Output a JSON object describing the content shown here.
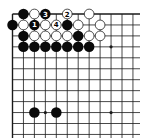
{
  "diagram": {
    "type": "go-board-partial",
    "view": "upper-left corner",
    "grid": {
      "origin_x": 12.5,
      "origin_y": 14,
      "spacing": 10.95,
      "cols_visible": 12,
      "rows_visible": 12,
      "edges": [
        "top",
        "left"
      ]
    },
    "colors": {
      "background": "#ffffff",
      "line": "#1a1a1a",
      "black_stone": "#0a0a0a",
      "white_stone_fill": "#ffffff",
      "white_stone_stroke": "#222222"
    },
    "star_points": [
      {
        "col": 9,
        "row": 3
      },
      {
        "col": 3,
        "row": 9
      },
      {
        "col": 9,
        "row": 9
      }
    ],
    "stones": [
      {
        "col": 1,
        "row": 0,
        "color": "black",
        "label": ""
      },
      {
        "col": 2,
        "row": 0,
        "color": "white",
        "label": ""
      },
      {
        "col": 3,
        "row": 0,
        "color": "black",
        "label": "3"
      },
      {
        "col": 5,
        "row": 0,
        "color": "white",
        "label": "2"
      },
      {
        "col": 7,
        "row": 0,
        "color": "white",
        "label": ""
      },
      {
        "col": 0,
        "row": 1,
        "color": "black",
        "label": ""
      },
      {
        "col": 1,
        "row": 1,
        "color": "white",
        "label": ""
      },
      {
        "col": 2,
        "row": 1,
        "color": "black",
        "label": "1"
      },
      {
        "col": 3,
        "row": 1,
        "color": "white",
        "label": ""
      },
      {
        "col": 4,
        "row": 1,
        "color": "white",
        "label": "4"
      },
      {
        "col": 5,
        "row": 1,
        "color": "black",
        "label": ""
      },
      {
        "col": 6,
        "row": 1,
        "color": "white",
        "label": ""
      },
      {
        "col": 8,
        "row": 1,
        "color": "white",
        "label": ""
      },
      {
        "col": 1,
        "row": 2,
        "color": "black",
        "label": ""
      },
      {
        "col": 2,
        "row": 2,
        "color": "white",
        "label": ""
      },
      {
        "col": 3,
        "row": 2,
        "color": "white",
        "label": ""
      },
      {
        "col": 4,
        "row": 2,
        "color": "white",
        "label": ""
      },
      {
        "col": 5,
        "row": 2,
        "color": "white",
        "label": ""
      },
      {
        "col": 6,
        "row": 2,
        "color": "black",
        "label": ""
      },
      {
        "col": 7,
        "row": 2,
        "color": "white",
        "label": ""
      },
      {
        "col": 8,
        "row": 2,
        "color": "white",
        "label": ""
      },
      {
        "col": 1,
        "row": 3,
        "color": "black",
        "label": ""
      },
      {
        "col": 2,
        "row": 3,
        "color": "black",
        "label": ""
      },
      {
        "col": 3,
        "row": 3,
        "color": "black",
        "label": ""
      },
      {
        "col": 4,
        "row": 3,
        "color": "black",
        "label": ""
      },
      {
        "col": 5,
        "row": 3,
        "color": "black",
        "label": ""
      },
      {
        "col": 6,
        "row": 3,
        "color": "black",
        "label": ""
      },
      {
        "col": 7,
        "row": 3,
        "color": "black",
        "label": ""
      },
      {
        "col": 2,
        "row": 9,
        "color": "black",
        "label": ""
      },
      {
        "col": 4,
        "row": 9,
        "color": "black",
        "label": ""
      }
    ],
    "move_labels": [
      "1",
      "2",
      "3",
      "4"
    ]
  }
}
